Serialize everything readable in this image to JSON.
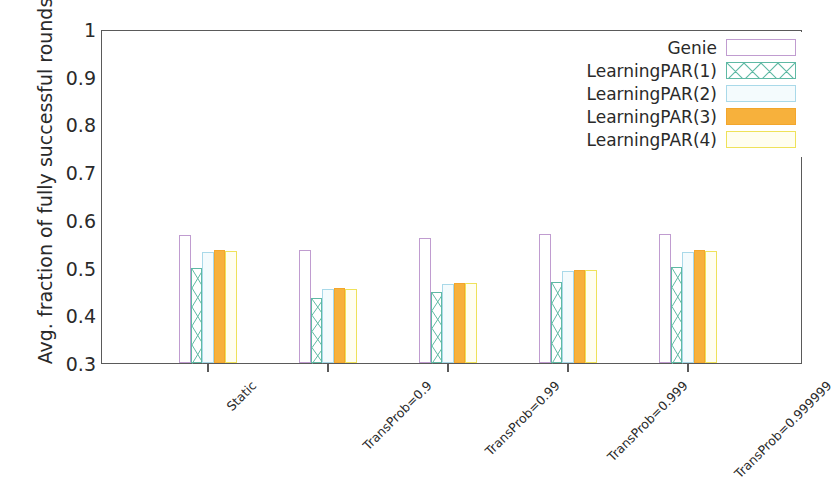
{
  "chart_data": {
    "type": "bar",
    "title": "",
    "xlabel": "",
    "ylabel": "Avg. fraction of fully successful rounds",
    "ylim": [
      0.3,
      1.0
    ],
    "yticks": [
      "0.3",
      "0.4",
      "0.5",
      "0.6",
      "0.7",
      "0.8",
      "0.9",
      "1"
    ],
    "grid": false,
    "legend_position": "top-right",
    "categories": [
      "Static",
      "TransProb=0.9",
      "TransProb=0.99",
      "TransProb=0.999",
      "TransProb=0.999999"
    ],
    "series": [
      {
        "name": "Genie",
        "color": "#c09cd0",
        "fill": "none",
        "pattern": "solid-outline",
        "values": [
          0.568,
          0.536,
          0.562,
          0.57,
          0.57
        ]
      },
      {
        "name": "LearningPAR(1)",
        "color": "#5fb9a4",
        "fill": "none",
        "pattern": "x-hatch",
        "values": [
          0.499,
          0.436,
          0.448,
          0.469,
          0.502
        ]
      },
      {
        "name": "LearningPAR(2)",
        "color": "#a9d9e9",
        "fill": "light",
        "pattern": "dotted",
        "values": [
          0.532,
          0.455,
          0.466,
          0.492,
          0.533
        ]
      },
      {
        "name": "LearningPAR(3)",
        "color": "#f3a62c",
        "fill": "solid",
        "pattern": "solid",
        "values": [
          0.536,
          0.457,
          0.468,
          0.495,
          0.537
        ]
      },
      {
        "name": "LearningPAR(4)",
        "color": "#efe25a",
        "fill": "none",
        "pattern": "solid-outline",
        "values": [
          0.535,
          0.456,
          0.467,
          0.494,
          0.535
        ]
      }
    ]
  },
  "legend": {
    "items": [
      {
        "label": "Genie"
      },
      {
        "label": "LearningPAR(1)"
      },
      {
        "label": "LearningPAR(2)"
      },
      {
        "label": "LearningPAR(3)"
      },
      {
        "label": "LearningPAR(4)"
      }
    ]
  }
}
